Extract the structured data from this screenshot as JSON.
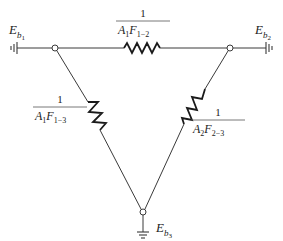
{
  "diagram": {
    "nodes": [
      {
        "id": "Eb1",
        "symbol": "E",
        "sub": "b",
        "subsub": "1"
      },
      {
        "id": "Eb2",
        "symbol": "E",
        "sub": "b",
        "subsub": "2"
      },
      {
        "id": "Eb3",
        "symbol": "E",
        "sub": "b",
        "subsub": "3"
      }
    ],
    "resistors": [
      {
        "id": "R12",
        "numerator": "1",
        "A": "A",
        "A_sub": "1",
        "F": "F",
        "F_sub": "1−2"
      },
      {
        "id": "R13",
        "numerator": "1",
        "A": "A",
        "A_sub": "1",
        "F": "F",
        "F_sub": "1−3"
      },
      {
        "id": "R23",
        "numerator": "1",
        "A": "A",
        "A_sub": "2",
        "F": "F",
        "F_sub": "2−3"
      }
    ],
    "colors": {
      "line": "#3a3a3a",
      "resistor": "#1a1a1a",
      "background": "#ffffff"
    }
  }
}
